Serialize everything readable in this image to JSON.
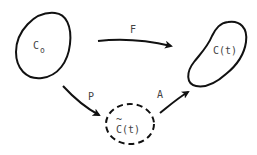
{
  "diagram": {
    "nodes": {
      "c0": {
        "label": "C",
        "subscript": "o",
        "style": "solid"
      },
      "ct": {
        "label": "C(t)",
        "style": "solid"
      },
      "ctilde": {
        "label": "C(t)",
        "accent": "~",
        "style": "dashed"
      }
    },
    "edges": {
      "f": {
        "label": "F",
        "from": "c0",
        "to": "ct"
      },
      "p": {
        "label": "P",
        "from": "c0",
        "to": "ctilde"
      },
      "a": {
        "label": "A",
        "from": "ctilde",
        "to": "ct"
      }
    },
    "colors": {
      "stroke": "#111111",
      "text": "#444444",
      "background": "#ffffff"
    }
  }
}
